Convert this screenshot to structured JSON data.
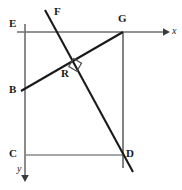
{
  "figure": {
    "type": "geometry-diagram",
    "width": 182,
    "height": 190,
    "background_color": "#ffffff",
    "stroke_colors": {
      "axis": "#6e6e70",
      "thin_segment": "#8a8a8c",
      "thick_segment": "#1a1a1a",
      "right_angle_mark": "#4a4a4c"
    }
  },
  "labels": {
    "E": "E",
    "F": "F",
    "G": "G",
    "B": "B",
    "R": "R",
    "C": "C",
    "D": "D",
    "x_axis": "x",
    "y_axis": "y"
  },
  "points": {
    "E": {
      "x": 13,
      "y": 23
    },
    "F": {
      "x": 57,
      "y": 11
    },
    "G": {
      "x": 123,
      "y": 24
    },
    "B": {
      "x": 13,
      "y": 89
    },
    "R": {
      "x": 64,
      "y": 73
    },
    "C": {
      "x": 12,
      "y": 153
    },
    "D": {
      "x": 128,
      "y": 155
    },
    "x_axis_label": {
      "x": 173,
      "y": 27
    },
    "y_axis_label": {
      "x": 18,
      "y": 166
    }
  },
  "geometry": {
    "origin": {
      "x": 25,
      "y": 32
    },
    "x_axis": {
      "x1": 17,
      "y1": 32,
      "x2": 168,
      "y2": 32
    },
    "y_axis": {
      "x1": 25,
      "y1": 24,
      "x2": 25,
      "y2": 180
    },
    "segment_CD": {
      "x1": 25,
      "y1": 155,
      "x2": 123,
      "y2": 155
    },
    "segment_GD_vertical": {
      "x1": 123,
      "y1": 32,
      "x2": 123,
      "y2": 168
    },
    "segment_BG": {
      "x1": 21,
      "y1": 91,
      "x2": 123,
      "y2": 32
    },
    "segment_F_line": {
      "x1": 45,
      "y1": 10,
      "x2": 133,
      "y2": 172
    },
    "intersection_R": {
      "x": 70,
      "y": 64
    },
    "right_angle_marker": {
      "x": 70,
      "y": 64,
      "size": 9
    }
  }
}
